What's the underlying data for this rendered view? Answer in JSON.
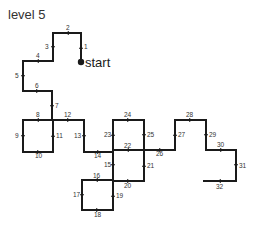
{
  "title": "level 5",
  "start_label": "start",
  "start_point": [
    81,
    62
  ],
  "colors": {
    "line": "#1a1a1a",
    "text": "#333333"
  },
  "path": [
    [
      81,
      62
    ],
    [
      81,
      33
    ],
    [
      53,
      33
    ],
    [
      53,
      61
    ],
    [
      23,
      61
    ],
    [
      23,
      91
    ],
    [
      52,
      91
    ],
    [
      52,
      120
    ],
    [
      23,
      120
    ],
    [
      23,
      152
    ],
    [
      53,
      152
    ],
    [
      53,
      120
    ],
    [
      84,
      120
    ],
    [
      84,
      152
    ],
    [
      113,
      152
    ],
    [
      113,
      180
    ],
    [
      82,
      180
    ],
    [
      82,
      210
    ],
    [
      113,
      210
    ],
    [
      113,
      181
    ],
    [
      144,
      181
    ],
    [
      144,
      150
    ],
    [
      113,
      150
    ],
    [
      113,
      120
    ],
    [
      144,
      120
    ],
    [
      144,
      150
    ],
    [
      175,
      150
    ],
    [
      175,
      120
    ],
    [
      206,
      120
    ],
    [
      206,
      150
    ],
    [
      236,
      150
    ],
    [
      236,
      181
    ],
    [
      204,
      181
    ]
  ],
  "steps": [
    {
      "n": "1",
      "x": 84,
      "y": 49,
      "ax": 81,
      "ay": 48,
      "dir": "up"
    },
    {
      "n": "2",
      "x": 66,
      "y": 30,
      "ax": 68,
      "ay": 33,
      "dir": "left"
    },
    {
      "n": "3",
      "x": 45,
      "y": 49,
      "ax": 53,
      "ay": 47,
      "dir": "down"
    },
    {
      "n": "4",
      "x": 36,
      "y": 58,
      "ax": 38,
      "ay": 61,
      "dir": "left"
    },
    {
      "n": "5",
      "x": 15,
      "y": 78,
      "ax": 23,
      "ay": 76,
      "dir": "down"
    },
    {
      "n": "6",
      "x": 35,
      "y": 88,
      "ax": 37,
      "ay": 91,
      "dir": "right"
    },
    {
      "n": "7",
      "x": 55,
      "y": 108,
      "ax": 52,
      "ay": 106,
      "dir": "down"
    },
    {
      "n": "8",
      "x": 36,
      "y": 117,
      "ax": 38,
      "ay": 120,
      "dir": "left"
    },
    {
      "n": "9",
      "x": 15,
      "y": 138,
      "ax": 23,
      "ay": 136,
      "dir": "down"
    },
    {
      "n": "10",
      "x": 35,
      "y": 158,
      "ax": 38,
      "ay": 152,
      "dir": "right"
    },
    {
      "n": "11",
      "x": 56,
      "y": 138,
      "ax": 53,
      "ay": 136,
      "dir": "up"
    },
    {
      "n": "12",
      "x": 64,
      "y": 117,
      "ax": 68,
      "ay": 120,
      "dir": "right"
    },
    {
      "n": "13",
      "x": 74,
      "y": 138,
      "ax": 84,
      "ay": 136,
      "dir": "down"
    },
    {
      "n": "14",
      "x": 94,
      "y": 158,
      "ax": 98,
      "ay": 152,
      "dir": "right"
    },
    {
      "n": "15",
      "x": 104,
      "y": 167,
      "ax": 113,
      "ay": 165,
      "dir": "down"
    },
    {
      "n": "16",
      "x": 93,
      "y": 178,
      "ax": 97,
      "ay": 180,
      "dir": "left"
    },
    {
      "n": "17",
      "x": 73,
      "y": 197,
      "ax": 82,
      "ay": 195,
      "dir": "down"
    },
    {
      "n": "18",
      "x": 94,
      "y": 217,
      "ax": 97,
      "ay": 210,
      "dir": "right"
    },
    {
      "n": "19",
      "x": 116,
      "y": 198,
      "ax": 113,
      "ay": 196,
      "dir": "up"
    },
    {
      "n": "20",
      "x": 124,
      "y": 188,
      "ax": 128,
      "ay": 181,
      "dir": "right"
    },
    {
      "n": "21",
      "x": 147,
      "y": 168,
      "ax": 144,
      "ay": 166,
      "dir": "up"
    },
    {
      "n": "22",
      "x": 124,
      "y": 148,
      "ax": 128,
      "ay": 150,
      "dir": "left"
    },
    {
      "n": "23",
      "x": 104,
      "y": 137,
      "ax": 113,
      "ay": 135,
      "dir": "up"
    },
    {
      "n": "24",
      "x": 124,
      "y": 117,
      "ax": 128,
      "ay": 120,
      "dir": "right"
    },
    {
      "n": "25",
      "x": 147,
      "y": 137,
      "ax": 144,
      "ay": 135,
      "dir": "down"
    },
    {
      "n": "26",
      "x": 156,
      "y": 156,
      "ax": 160,
      "ay": 150,
      "dir": "right"
    },
    {
      "n": "27",
      "x": 178,
      "y": 137,
      "ax": 175,
      "ay": 135,
      "dir": "up"
    },
    {
      "n": "28",
      "x": 186,
      "y": 117,
      "ax": 190,
      "ay": 120,
      "dir": "right"
    },
    {
      "n": "29",
      "x": 209,
      "y": 137,
      "ax": 206,
      "ay": 135,
      "dir": "down"
    },
    {
      "n": "30",
      "x": 217,
      "y": 147,
      "ax": 221,
      "ay": 150,
      "dir": "right"
    },
    {
      "n": "31",
      "x": 239,
      "y": 168,
      "ax": 236,
      "ay": 165,
      "dir": "down"
    },
    {
      "n": "32",
      "x": 216,
      "y": 189,
      "ax": 220,
      "ay": 181,
      "dir": "left"
    }
  ]
}
